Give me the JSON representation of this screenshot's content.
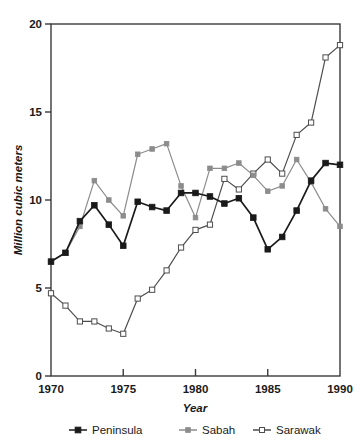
{
  "chart_data": {
    "type": "line",
    "title": "",
    "xlabel": "Year",
    "ylabel": "Million cubic meters",
    "xlim": [
      1970,
      1990
    ],
    "ylim": [
      0,
      20
    ],
    "xticks": [
      1970,
      1975,
      1980,
      1985,
      1990
    ],
    "yticks": [
      0,
      5,
      10,
      15,
      20
    ],
    "xtick_labels": [
      "1970",
      "1975",
      "1980",
      "1985",
      "1990"
    ],
    "ytick_labels": [
      "0",
      "5",
      "10",
      "15",
      "20"
    ],
    "grid": false,
    "legend_position": "bottom",
    "x": [
      1970,
      1971,
      1972,
      1973,
      1974,
      1975,
      1976,
      1977,
      1978,
      1979,
      1980,
      1981,
      1982,
      1983,
      1984,
      1985,
      1986,
      1987,
      1988,
      1989,
      1990
    ],
    "series": [
      {
        "name": "Peninsula",
        "marker": "filled-square",
        "color": "#1a1a1a",
        "values": [
          6.5,
          7.0,
          8.8,
          9.7,
          8.6,
          7.4,
          9.9,
          9.6,
          9.4,
          10.4,
          10.4,
          10.2,
          9.8,
          10.1,
          9.0,
          7.2,
          7.9,
          9.4,
          11.1,
          12.1,
          12.0
        ]
      },
      {
        "name": "Sabah",
        "marker": "filled-square",
        "color": "#8c8c8c",
        "values": [
          6.5,
          7.0,
          8.5,
          11.1,
          10.0,
          9.1,
          12.6,
          12.9,
          13.2,
          10.8,
          9.0,
          11.8,
          11.8,
          12.1,
          11.4,
          10.5,
          10.8,
          12.3,
          11.0,
          9.5,
          8.5
        ]
      },
      {
        "name": "Sarawak",
        "marker": "open-square",
        "color": "#ffffff",
        "values": [
          4.7,
          4.0,
          3.1,
          3.1,
          2.7,
          2.4,
          4.4,
          4.9,
          6.0,
          7.3,
          8.3,
          8.6,
          11.2,
          10.6,
          11.5,
          12.3,
          11.5,
          13.7,
          14.4,
          18.1,
          18.8
        ]
      }
    ]
  },
  "legend": {
    "items": [
      {
        "label": "Peninsula",
        "marker": "filled-square-dark"
      },
      {
        "label": "Sabah",
        "marker": "filled-square-gray"
      },
      {
        "label": "Sarawak",
        "marker": "open-square"
      }
    ]
  },
  "axes": {
    "x_title": "Year",
    "y_title": "Million cubic meters"
  },
  "colors": {
    "peninsula": "#1a1a1a",
    "sabah": "#8c8c8c",
    "sarawak_line": "#4d4d4d",
    "sarawak_fill": "#ffffff",
    "frame": "#3a3a3a",
    "text": "#1a1a1a",
    "background": "#ffffff"
  }
}
